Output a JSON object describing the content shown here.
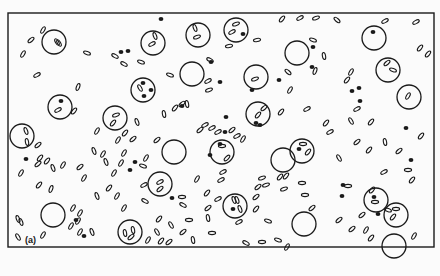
{
  "figure": {
    "panel_label": "(a)",
    "panel_label_pos": [
      25,
      244
    ],
    "frame": {
      "x": 8,
      "y": 13,
      "w": 426,
      "h": 234
    },
    "colors": {
      "ink": "#1a1a1a",
      "paper": "#fbfbfb"
    },
    "cells": [
      {
        "x": 54,
        "y": 42,
        "r": 12,
        "contents": [
          {
            "t": "e",
            "x": 57,
            "y": 42,
            "a": 60
          },
          {
            "t": "e",
            "x": 59,
            "y": 43,
            "a": 60
          }
        ]
      },
      {
        "x": 153,
        "y": 43,
        "r": 12,
        "contents": [
          {
            "t": "e",
            "x": 152,
            "y": 44,
            "a": -30
          },
          {
            "t": "e",
            "x": 155,
            "y": 36,
            "a": 70
          }
        ]
      },
      {
        "x": 198,
        "y": 35,
        "r": 12,
        "contents": [
          {
            "t": "e",
            "x": 195,
            "y": 28,
            "a": 70
          },
          {
            "t": "e",
            "x": 197,
            "y": 37,
            "a": -20
          }
        ]
      },
      {
        "x": 236,
        "y": 30,
        "r": 12,
        "contents": [
          {
            "t": "e",
            "x": 236,
            "y": 24,
            "a": -20
          },
          {
            "t": "e",
            "x": 232,
            "y": 32,
            "a": -30
          },
          {
            "t": "d",
            "x": 243,
            "y": 34
          }
        ]
      },
      {
        "x": 297,
        "y": 53,
        "r": 12,
        "contents": []
      },
      {
        "x": 374,
        "y": 38,
        "r": 12,
        "contents": [
          {
            "t": "d",
            "x": 373,
            "y": 32
          }
        ]
      },
      {
        "x": 192,
        "y": 74,
        "r": 12,
        "contents": []
      },
      {
        "x": 256,
        "y": 77,
        "r": 12,
        "contents": [
          {
            "t": "e",
            "x": 255,
            "y": 79,
            "a": -20
          }
        ]
      },
      {
        "x": 143,
        "y": 90,
        "r": 12,
        "contents": [
          {
            "t": "d",
            "x": 143,
            "y": 83
          },
          {
            "t": "d",
            "x": 151,
            "y": 90
          },
          {
            "t": "d",
            "x": 144,
            "y": 96
          },
          {
            "t": "e",
            "x": 140,
            "y": 88,
            "a": 60
          }
        ]
      },
      {
        "x": 388,
        "y": 70,
        "r": 12,
        "contents": [
          {
            "t": "e",
            "x": 387,
            "y": 63,
            "a": -40
          },
          {
            "t": "e",
            "x": 393,
            "y": 70,
            "a": 20
          }
        ]
      },
      {
        "x": 60,
        "y": 107,
        "r": 12,
        "contents": [
          {
            "t": "d",
            "x": 61,
            "y": 101
          },
          {
            "t": "e",
            "x": 58,
            "y": 110,
            "a": -30
          }
        ]
      },
      {
        "x": 115,
        "y": 118,
        "r": 12,
        "contents": [
          {
            "t": "e",
            "x": 116,
            "y": 115,
            "a": -20
          },
          {
            "t": "e",
            "x": 113,
            "y": 123,
            "a": -50
          }
        ]
      },
      {
        "x": 409,
        "y": 97,
        "r": 12,
        "contents": [
          {
            "t": "e",
            "x": 408,
            "y": 96,
            "a": -60
          }
        ]
      },
      {
        "x": 22,
        "y": 136,
        "r": 12,
        "contents": [
          {
            "t": "e",
            "x": 26,
            "y": 131,
            "a": 70
          },
          {
            "t": "e",
            "x": 27,
            "y": 142,
            "a": 80
          }
        ]
      },
      {
        "x": 258,
        "y": 114,
        "r": 12,
        "contents": [
          {
            "t": "e",
            "x": 258,
            "y": 115,
            "a": -50
          }
        ]
      },
      {
        "x": 174,
        "y": 152,
        "r": 12,
        "contents": []
      },
      {
        "x": 222,
        "y": 152,
        "r": 12,
        "contents": [
          {
            "t": "e",
            "x": 222,
            "y": 146,
            "a": 0
          },
          {
            "t": "e",
            "x": 227,
            "y": 158,
            "a": -45
          }
        ]
      },
      {
        "x": 283,
        "y": 160,
        "r": 12,
        "contents": []
      },
      {
        "x": 302,
        "y": 151,
        "r": 12,
        "contents": [
          {
            "t": "e",
            "x": 303,
            "y": 144,
            "a": 0
          },
          {
            "t": "e",
            "x": 308,
            "y": 152,
            "a": -50
          },
          {
            "t": "d",
            "x": 299,
            "y": 149
          }
        ]
      },
      {
        "x": 160,
        "y": 184,
        "r": 12,
        "contents": [
          {
            "t": "e",
            "x": 160,
            "y": 182,
            "a": -30
          },
          {
            "t": "e",
            "x": 160,
            "y": 189,
            "a": -40
          }
        ]
      },
      {
        "x": 53,
        "y": 215,
        "r": 12,
        "contents": []
      },
      {
        "x": 235,
        "y": 206,
        "r": 12,
        "contents": [
          {
            "t": "e",
            "x": 234,
            "y": 200,
            "a": 70
          },
          {
            "t": "e",
            "x": 237,
            "y": 200,
            "a": 70
          },
          {
            "t": "d",
            "x": 233,
            "y": 209
          },
          {
            "t": "e",
            "x": 240,
            "y": 209,
            "a": 70
          }
        ]
      },
      {
        "x": 376,
        "y": 200,
        "r": 12,
        "contents": [
          {
            "t": "d",
            "x": 374,
            "y": 197
          },
          {
            "t": "e",
            "x": 375,
            "y": 202,
            "a": 0
          }
        ]
      },
      {
        "x": 396,
        "y": 215,
        "r": 12,
        "contents": [
          {
            "t": "e",
            "x": 396,
            "y": 209,
            "a": 0
          },
          {
            "t": "e",
            "x": 393,
            "y": 217,
            "a": -50
          }
        ]
      },
      {
        "x": 130,
        "y": 232,
        "r": 12,
        "contents": [
          {
            "t": "e",
            "x": 125,
            "y": 233,
            "a": 80
          },
          {
            "t": "e",
            "x": 133,
            "y": 230,
            "a": 80
          },
          {
            "t": "e",
            "x": 131,
            "y": 237,
            "a": -40
          }
        ]
      },
      {
        "x": 304,
        "y": 224,
        "r": 12,
        "contents": []
      },
      {
        "x": 394,
        "y": 246,
        "r": 12,
        "contents": []
      }
    ],
    "free_ellipses": [
      {
        "x": 43,
        "y": 30,
        "a": -60
      },
      {
        "x": 31,
        "y": 40,
        "a": -40
      },
      {
        "x": 23,
        "y": 54,
        "a": -60
      },
      {
        "x": 37,
        "y": 75,
        "a": -30
      },
      {
        "x": 87,
        "y": 53,
        "a": 20
      },
      {
        "x": 115,
        "y": 56,
        "a": 30
      },
      {
        "x": 124,
        "y": 64,
        "a": 30
      },
      {
        "x": 141,
        "y": 62,
        "a": 20
      },
      {
        "x": 78,
        "y": 87,
        "a": -70
      },
      {
        "x": 74,
        "y": 111,
        "a": -50
      },
      {
        "x": 137,
        "y": 122,
        "a": 70
      },
      {
        "x": 164,
        "y": 114,
        "a": 80
      },
      {
        "x": 187,
        "y": 104,
        "a": 80
      },
      {
        "x": 208,
        "y": 81,
        "a": -30
      },
      {
        "x": 209,
        "y": 90,
        "a": -20
      },
      {
        "x": 175,
        "y": 108,
        "a": -50
      },
      {
        "x": 170,
        "y": 75,
        "a": 20
      },
      {
        "x": 182,
        "y": 104,
        "a": -40
      },
      {
        "x": 210,
        "y": 60,
        "a": 30
      },
      {
        "x": 229,
        "y": 46,
        "a": -10
      },
      {
        "x": 257,
        "y": 40,
        "a": -10
      },
      {
        "x": 282,
        "y": 19,
        "a": -50
      },
      {
        "x": 300,
        "y": 18,
        "a": -30
      },
      {
        "x": 316,
        "y": 18,
        "a": -20
      },
      {
        "x": 337,
        "y": 20,
        "a": 40
      },
      {
        "x": 313,
        "y": 40,
        "a": 20
      },
      {
        "x": 324,
        "y": 56,
        "a": 80
      },
      {
        "x": 315,
        "y": 71,
        "a": -70
      },
      {
        "x": 288,
        "y": 72,
        "a": 40
      },
      {
        "x": 290,
        "y": 90,
        "a": -60
      },
      {
        "x": 281,
        "y": 112,
        "a": -50
      },
      {
        "x": 307,
        "y": 109,
        "a": -30
      },
      {
        "x": 326,
        "y": 123,
        "a": -50
      },
      {
        "x": 351,
        "y": 72,
        "a": -60
      },
      {
        "x": 347,
        "y": 80,
        "a": -50
      },
      {
        "x": 385,
        "y": 21,
        "a": -30
      },
      {
        "x": 416,
        "y": 22,
        "a": -30
      },
      {
        "x": 420,
        "y": 48,
        "a": -50
      },
      {
        "x": 428,
        "y": 54,
        "a": -50
      },
      {
        "x": 357,
        "y": 109,
        "a": -30
      },
      {
        "x": 351,
        "y": 121,
        "a": 60
      },
      {
        "x": 371,
        "y": 122,
        "a": -50
      },
      {
        "x": 357,
        "y": 142,
        "a": -40
      },
      {
        "x": 385,
        "y": 142,
        "a": 80
      },
      {
        "x": 421,
        "y": 136,
        "a": -50
      },
      {
        "x": 330,
        "y": 132,
        "a": -30
      },
      {
        "x": 339,
        "y": 158,
        "a": 60
      },
      {
        "x": 369,
        "y": 150,
        "a": -50
      },
      {
        "x": 399,
        "y": 151,
        "a": -40
      },
      {
        "x": 384,
        "y": 172,
        "a": -30
      },
      {
        "x": 412,
        "y": 180,
        "a": -50
      },
      {
        "x": 348,
        "y": 186,
        "a": 0
      },
      {
        "x": 362,
        "y": 215,
        "a": -40
      },
      {
        "x": 388,
        "y": 210,
        "a": 20
      },
      {
        "x": 372,
        "y": 190,
        "a": -50
      },
      {
        "x": 408,
        "y": 170,
        "a": 0
      },
      {
        "x": 339,
        "y": 220,
        "a": -40
      },
      {
        "x": 352,
        "y": 229,
        "a": -40
      },
      {
        "x": 371,
        "y": 238,
        "a": -50
      },
      {
        "x": 366,
        "y": 230,
        "a": -60
      },
      {
        "x": 414,
        "y": 236,
        "a": -60
      },
      {
        "x": 302,
        "y": 183,
        "a": 0
      },
      {
        "x": 305,
        "y": 195,
        "a": 0
      },
      {
        "x": 312,
        "y": 208,
        "a": -40
      },
      {
        "x": 280,
        "y": 177,
        "a": -50
      },
      {
        "x": 266,
        "y": 185,
        "a": -20
      },
      {
        "x": 262,
        "y": 178,
        "a": -20
      },
      {
        "x": 256,
        "y": 197,
        "a": -40
      },
      {
        "x": 258,
        "y": 187,
        "a": -40
      },
      {
        "x": 284,
        "y": 189,
        "a": -20
      },
      {
        "x": 268,
        "y": 221,
        "a": 20
      },
      {
        "x": 239,
        "y": 222,
        "a": -30
      },
      {
        "x": 246,
        "y": 243,
        "a": 30
      },
      {
        "x": 262,
        "y": 242,
        "a": 0
      },
      {
        "x": 278,
        "y": 240,
        "a": 20
      },
      {
        "x": 287,
        "y": 247,
        "a": -60
      },
      {
        "x": 286,
        "y": 176,
        "a": -50
      },
      {
        "x": 207,
        "y": 193,
        "a": -50
      },
      {
        "x": 218,
        "y": 199,
        "a": -30
      },
      {
        "x": 221,
        "y": 180,
        "a": -30
      },
      {
        "x": 183,
        "y": 205,
        "a": 30
      },
      {
        "x": 208,
        "y": 208,
        "a": -40
      },
      {
        "x": 208,
        "y": 218,
        "a": 80
      },
      {
        "x": 256,
        "y": 209,
        "a": -50
      },
      {
        "x": 197,
        "y": 179,
        "a": -60
      },
      {
        "x": 182,
        "y": 197,
        "a": 0
      },
      {
        "x": 159,
        "y": 219,
        "a": -50
      },
      {
        "x": 171,
        "y": 225,
        "a": 60
      },
      {
        "x": 183,
        "y": 232,
        "a": -40
      },
      {
        "x": 193,
        "y": 240,
        "a": 80
      },
      {
        "x": 157,
        "y": 232,
        "a": 60
      },
      {
        "x": 161,
        "y": 241,
        "a": -50
      },
      {
        "x": 212,
        "y": 233,
        "a": 0
      },
      {
        "x": 189,
        "y": 220,
        "a": 0
      },
      {
        "x": 148,
        "y": 240,
        "a": -60
      },
      {
        "x": 103,
        "y": 154,
        "a": -60
      },
      {
        "x": 106,
        "y": 162,
        "a": 70
      },
      {
        "x": 121,
        "y": 163,
        "a": -60
      },
      {
        "x": 124,
        "y": 153,
        "a": -60
      },
      {
        "x": 114,
        "y": 173,
        "a": -60
      },
      {
        "x": 109,
        "y": 188,
        "a": -50
      },
      {
        "x": 97,
        "y": 196,
        "a": 70
      },
      {
        "x": 117,
        "y": 196,
        "a": -60
      },
      {
        "x": 94,
        "y": 151,
        "a": 70
      },
      {
        "x": 84,
        "y": 178,
        "a": -60
      },
      {
        "x": 80,
        "y": 167,
        "a": -40
      },
      {
        "x": 145,
        "y": 201,
        "a": 30
      },
      {
        "x": 143,
        "y": 166,
        "a": 20
      },
      {
        "x": 146,
        "y": 158,
        "a": -60
      },
      {
        "x": 157,
        "y": 140,
        "a": -40
      },
      {
        "x": 118,
        "y": 140,
        "a": -60
      },
      {
        "x": 133,
        "y": 139,
        "a": -40
      },
      {
        "x": 125,
        "y": 133,
        "a": -50
      },
      {
        "x": 63,
        "y": 165,
        "a": -60
      },
      {
        "x": 53,
        "y": 168,
        "a": 70
      },
      {
        "x": 47,
        "y": 161,
        "a": -50
      },
      {
        "x": 40,
        "y": 158,
        "a": -50
      },
      {
        "x": 21,
        "y": 173,
        "a": -60
      },
      {
        "x": 39,
        "y": 185,
        "a": -50
      },
      {
        "x": 38,
        "y": 164,
        "a": -40
      },
      {
        "x": 51,
        "y": 189,
        "a": -70
      },
      {
        "x": 73,
        "y": 208,
        "a": -60
      },
      {
        "x": 43,
        "y": 235,
        "a": -60
      },
      {
        "x": 18,
        "y": 219,
        "a": 70
      },
      {
        "x": 21,
        "y": 222,
        "a": 70
      },
      {
        "x": 18,
        "y": 237,
        "a": 60
      },
      {
        "x": 71,
        "y": 226,
        "a": -60
      },
      {
        "x": 78,
        "y": 221,
        "a": -60
      },
      {
        "x": 80,
        "y": 213,
        "a": -60
      },
      {
        "x": 80,
        "y": 232,
        "a": -60
      },
      {
        "x": 92,
        "y": 232,
        "a": 70
      },
      {
        "x": 144,
        "y": 185,
        "a": -30
      },
      {
        "x": 124,
        "y": 208,
        "a": -60
      },
      {
        "x": 169,
        "y": 242,
        "a": -40
      },
      {
        "x": 223,
        "y": 172,
        "a": -30
      },
      {
        "x": 97,
        "y": 131,
        "a": -60
      },
      {
        "x": 38,
        "y": 145,
        "a": -40
      },
      {
        "x": 237,
        "y": 136,
        "a": -30
      },
      {
        "x": 243,
        "y": 139,
        "a": -60
      },
      {
        "x": 264,
        "y": 108,
        "a": -40
      },
      {
        "x": 205,
        "y": 125,
        "a": -30
      },
      {
        "x": 200,
        "y": 130,
        "a": -40
      },
      {
        "x": 218,
        "y": 132,
        "a": -30
      },
      {
        "x": 232,
        "y": 130,
        "a": -40
      },
      {
        "x": 212,
        "y": 128,
        "a": -30
      }
    ],
    "free_dots": [
      {
        "x": 161,
        "y": 19
      },
      {
        "x": 121,
        "y": 52
      },
      {
        "x": 128,
        "y": 51
      },
      {
        "x": 211,
        "y": 62
      },
      {
        "x": 182,
        "y": 106
      },
      {
        "x": 220,
        "y": 82
      },
      {
        "x": 313,
        "y": 47
      },
      {
        "x": 279,
        "y": 80
      },
      {
        "x": 252,
        "y": 90
      },
      {
        "x": 312,
        "y": 67
      },
      {
        "x": 352,
        "y": 91
      },
      {
        "x": 359,
        "y": 88
      },
      {
        "x": 360,
        "y": 101
      },
      {
        "x": 406,
        "y": 128
      },
      {
        "x": 411,
        "y": 160
      },
      {
        "x": 26,
        "y": 159
      },
      {
        "x": 135,
        "y": 162
      },
      {
        "x": 130,
        "y": 170
      },
      {
        "x": 226,
        "y": 117
      },
      {
        "x": 225,
        "y": 132
      },
      {
        "x": 172,
        "y": 198
      },
      {
        "x": 210,
        "y": 155
      },
      {
        "x": 76,
        "y": 220
      },
      {
        "x": 84,
        "y": 236
      },
      {
        "x": 256,
        "y": 123
      },
      {
        "x": 260,
        "y": 125
      },
      {
        "x": 343,
        "y": 185
      },
      {
        "x": 342,
        "y": 196
      },
      {
        "x": 378,
        "y": 214
      },
      {
        "x": 220,
        "y": 144
      }
    ]
  }
}
